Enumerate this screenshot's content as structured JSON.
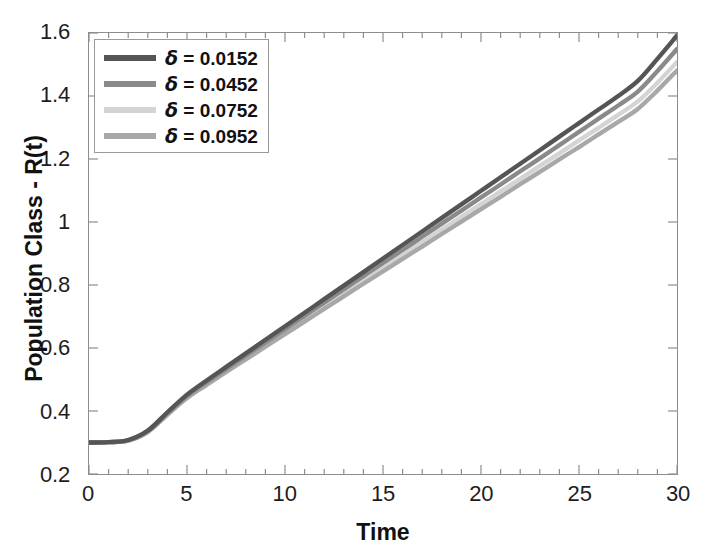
{
  "chart_data": {
    "type": "line",
    "title": "",
    "xlabel": "Time",
    "ylabel": "Population Class - R(t)",
    "xlim": [
      0,
      30
    ],
    "ylim": [
      0.2,
      1.6
    ],
    "xticks": [
      "0",
      "5",
      "10",
      "15",
      "20",
      "25",
      "30"
    ],
    "xtick_values": [
      0,
      5,
      10,
      15,
      20,
      25,
      30
    ],
    "yticks": [
      "0.2",
      "0.4",
      "0.6",
      "0.8",
      "1",
      "1.2",
      "1.4",
      "1.6"
    ],
    "ytick_values": [
      0.2,
      0.4,
      0.6,
      0.8,
      1.0,
      1.2,
      1.4,
      1.6
    ],
    "grid": false,
    "legend_position": "upper left",
    "x": [
      0,
      1,
      2,
      3,
      4,
      5,
      6,
      7,
      8,
      9,
      10,
      11,
      12,
      13,
      14,
      15,
      16,
      17,
      18,
      19,
      20,
      21,
      22,
      23,
      24,
      25,
      26,
      27,
      28,
      29,
      30
    ],
    "series": [
      {
        "name": "δ = 0.0152",
        "delta": 0.0152,
        "color": "#555555",
        "values": [
          0.3,
          0.301,
          0.308,
          0.338,
          0.396,
          0.452,
          0.497,
          0.54,
          0.583,
          0.626,
          0.669,
          0.712,
          0.755,
          0.798,
          0.841,
          0.884,
          0.927,
          0.97,
          1.013,
          1.056,
          1.099,
          1.142,
          1.185,
          1.228,
          1.271,
          1.314,
          1.357,
          1.4,
          1.448,
          1.518,
          1.592
        ]
      },
      {
        "name": "δ = 0.0452",
        "delta": 0.0452,
        "color": "#8a8a8a",
        "values": [
          0.3,
          0.301,
          0.307,
          0.336,
          0.393,
          0.448,
          0.492,
          0.534,
          0.576,
          0.618,
          0.66,
          0.702,
          0.744,
          0.786,
          0.828,
          0.87,
          0.911,
          0.953,
          0.995,
          1.036,
          1.078,
          1.119,
          1.161,
          1.202,
          1.244,
          1.286,
          1.328,
          1.37,
          1.414,
          1.479,
          1.549
        ]
      },
      {
        "name": "δ = 0.0752",
        "delta": 0.0752,
        "color": "#d4d4d4",
        "values": [
          0.3,
          0.301,
          0.306,
          0.334,
          0.39,
          0.444,
          0.487,
          0.528,
          0.569,
          0.61,
          0.651,
          0.692,
          0.733,
          0.773,
          0.814,
          0.855,
          0.895,
          0.936,
          0.976,
          1.016,
          1.057,
          1.097,
          1.137,
          1.178,
          1.218,
          1.259,
          1.299,
          1.34,
          1.383,
          1.442,
          1.508
        ]
      },
      {
        "name": "δ = 0.0952",
        "delta": 0.0952,
        "color": "#a8a8a8",
        "values": [
          0.3,
          0.301,
          0.306,
          0.333,
          0.388,
          0.441,
          0.483,
          0.524,
          0.564,
          0.604,
          0.644,
          0.684,
          0.724,
          0.764,
          0.804,
          0.843,
          0.883,
          0.922,
          0.962,
          1.001,
          1.041,
          1.08,
          1.12,
          1.159,
          1.199,
          1.238,
          1.278,
          1.318,
          1.359,
          1.417,
          1.481
        ]
      }
    ]
  },
  "axes": {
    "x_title": "Time",
    "y_title": "Population Class - R(t)"
  },
  "legend": {
    "entries": [
      {
        "label": "δ = 0.0152",
        "symbol": "δ",
        "equals": "=",
        "value": "0.0152",
        "color": "#555555"
      },
      {
        "label": "δ = 0.0452",
        "symbol": "δ",
        "equals": "=",
        "value": "0.0452",
        "color": "#8a8a8a"
      },
      {
        "label": "δ = 0.0752",
        "symbol": "δ",
        "equals": "=",
        "value": "0.0752",
        "color": "#d4d4d4"
      },
      {
        "label": "δ = 0.0952",
        "symbol": "δ",
        "equals": "=",
        "value": "0.0952",
        "color": "#a8a8a8"
      }
    ]
  },
  "style": {
    "frame_color": "#8d8d8d",
    "text_color": "#1a1a1a",
    "background": "#ffffff"
  }
}
